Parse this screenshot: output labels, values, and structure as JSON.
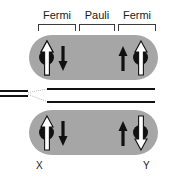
{
  "figure": {
    "background_color": "#ffffff",
    "width": 170,
    "height": 179
  },
  "regions": {
    "labels": [
      {
        "text": "Fermi",
        "x": 38,
        "y": 9,
        "width": 38
      },
      {
        "text": "Pauli",
        "x": 80,
        "y": 9,
        "width": 34
      },
      {
        "text": "Fermi",
        "x": 118,
        "y": 9,
        "width": 38
      }
    ],
    "brackets": [
      {
        "name": "fermi-left-bracket",
        "x": 38,
        "y": 24,
        "width": 38
      },
      {
        "name": "pauli-bracket",
        "x": 79,
        "y": 24,
        "width": 36
      },
      {
        "name": "fermi-right-bracket",
        "x": 118,
        "y": 24,
        "width": 38
      }
    ]
  },
  "molecules": [
    {
      "name": "upper-state",
      "color": "#a6a6a6",
      "x": 29,
      "y": 35,
      "width": 129,
      "height": 45,
      "arrows": [
        {
          "name": "arrow-up-white-left",
          "direction": "up",
          "fill": "white",
          "x": 40,
          "y": 41,
          "width": 12,
          "height": 33,
          "dot": true
        },
        {
          "name": "arrow-down-black-left",
          "direction": "down",
          "fill": "black",
          "x": 58,
          "y": 46,
          "width": 9,
          "height": 24,
          "dot": false
        },
        {
          "name": "arrow-up-black-right",
          "direction": "up",
          "fill": "black",
          "x": 118,
          "y": 46,
          "width": 9,
          "height": 24,
          "dot": false
        },
        {
          "name": "arrow-up-white-right",
          "direction": "up",
          "fill": "white",
          "x": 134,
          "y": 41,
          "width": 12,
          "height": 33,
          "dot": true
        }
      ]
    },
    {
      "name": "lower-state",
      "color": "#a6a6a6",
      "x": 29,
      "y": 110,
      "width": 129,
      "height": 45,
      "arrows": [
        {
          "name": "arrow-up-white-left",
          "direction": "up",
          "fill": "white",
          "x": 40,
          "y": 116,
          "width": 12,
          "height": 33,
          "dot": true
        },
        {
          "name": "arrow-down-black-left",
          "direction": "down",
          "fill": "black",
          "x": 58,
          "y": 121,
          "width": 9,
          "height": 24,
          "dot": false
        },
        {
          "name": "arrow-up-black-right",
          "direction": "up",
          "fill": "black",
          "x": 118,
          "y": 121,
          "width": 9,
          "height": 24,
          "dot": false
        },
        {
          "name": "arrow-down-white-right",
          "direction": "down",
          "fill": "white",
          "x": 134,
          "y": 116,
          "width": 12,
          "height": 33,
          "dot": true
        }
      ]
    }
  ],
  "energy_levels": {
    "lead_lines": [
      {
        "name": "lead-line-upper",
        "x": 0,
        "y": 90,
        "width": 28
      },
      {
        "name": "lead-line-lower",
        "x": 0,
        "y": 95,
        "width": 28
      }
    ],
    "split_lines": [
      {
        "name": "level-line-upper",
        "x": 47,
        "y": 88,
        "width": 108
      },
      {
        "name": "level-line-lower",
        "x": 47,
        "y": 101,
        "width": 108
      }
    ],
    "guides": [
      {
        "name": "split-guide-upper",
        "x": 28,
        "y": 92,
        "length": 21,
        "angle": -10
      },
      {
        "name": "split-guide-lower",
        "x": 28,
        "y": 94,
        "length": 21,
        "angle": 20
      }
    ]
  },
  "endpoints": [
    {
      "name": "endpoint-label-x",
      "text": "X",
      "x": 36,
      "y": 160
    },
    {
      "name": "endpoint-label-y",
      "text": "Y",
      "x": 143,
      "y": 160
    }
  ],
  "colors": {
    "molecule_gray": "#a6a6a6",
    "line_black": "#111111",
    "text_black": "#1a1a1a",
    "bracket_gray": "#3a3a3a",
    "arrow_white": "#ffffff",
    "arrow_black": "#111111",
    "guide_gray": "#b8b8b8"
  }
}
